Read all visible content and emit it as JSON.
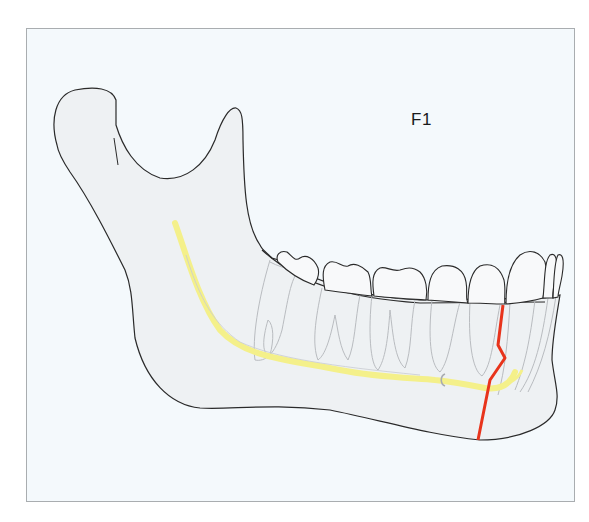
{
  "figure": {
    "label": "F1",
    "colors": {
      "frame_border": "#a9adb0",
      "background": "#f4f9fc",
      "bone_fill": "#eef1f3",
      "outline": "#2a2a2a",
      "tooth_root": "#b9bcc0",
      "nerve_canal": "#f4f08a",
      "fracture_line": "#e8341c"
    },
    "elements": [
      {
        "name": "mandible-outline",
        "description": "Outline of lower jaw bone with condyle and coronoid process"
      },
      {
        "name": "teeth",
        "description": "Row of molars, premolars, canine and incisors"
      },
      {
        "name": "mandibular-canal",
        "description": "Yellow inferior alveolar nerve canal"
      },
      {
        "name": "fracture-line",
        "description": "Red zig-zag fracture line in the canine/premolar region"
      }
    ]
  }
}
